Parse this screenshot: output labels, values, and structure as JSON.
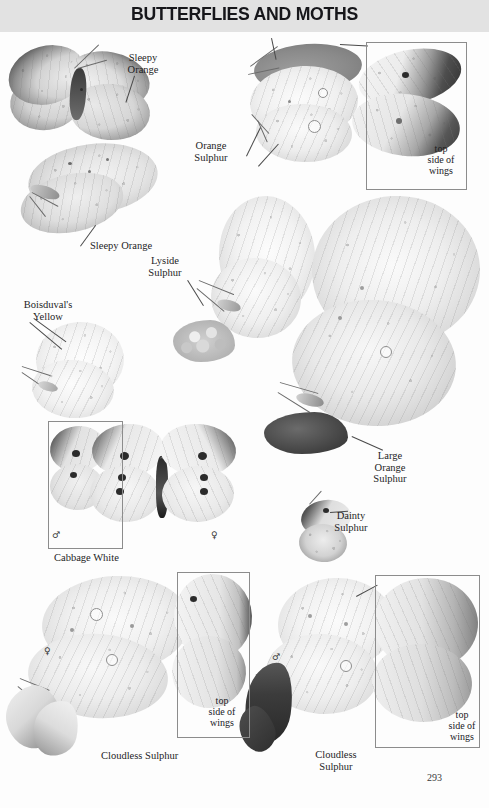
{
  "page": {
    "header_title": "BUTTERFLIES AND MOTHS",
    "page_number": "293",
    "background_color": "#fdfdfd",
    "header_band_color": "#e2e2e2",
    "text_color": "#1d1d1f"
  },
  "species_labels": [
    {
      "id": "sleepy-orange-top",
      "text": "Sleepy\nOrange",
      "x": 143,
      "y": 52,
      "align": "center"
    },
    {
      "id": "orange-sulphur",
      "text": "Orange\nSulphur",
      "x": 211,
      "y": 140,
      "align": "center"
    },
    {
      "id": "sleepy-orange-bottom",
      "text": "Sleepy Orange",
      "x": 90,
      "y": 240,
      "align": "left"
    },
    {
      "id": "lyside-sulphur",
      "text": "Lyside\nSulphur",
      "x": 165,
      "y": 255,
      "align": "center"
    },
    {
      "id": "boisduvals-yellow",
      "text": "Boisduval's\nYellow",
      "x": 42,
      "y": 299,
      "align": "center"
    },
    {
      "id": "large-orange-sulphur",
      "text": "Large\nOrange\nSulphur",
      "x": 389,
      "y": 450,
      "align": "center"
    },
    {
      "id": "dainty-sulphur",
      "text": "Dainty\nSulphur",
      "x": 350,
      "y": 510,
      "align": "center"
    },
    {
      "id": "cabbage-white",
      "text": "Cabbage White",
      "x": 54,
      "y": 552,
      "align": "left"
    },
    {
      "id": "cloudless-sulphur-left",
      "text": "Cloudless Sulphur",
      "x": 101,
      "y": 750,
      "align": "left"
    },
    {
      "id": "cloudless-sulphur-right",
      "text": "Cloudless\nSulphur",
      "x": 335,
      "y": 749,
      "align": "center"
    }
  ],
  "inset_boxes": [
    {
      "id": "top-side-wings-orange-sulphur",
      "caption": "top\nside of\nwings",
      "x": 366,
      "y": 42,
      "w": 101,
      "h": 148,
      "caption_x": 441,
      "caption_y": 149
    },
    {
      "id": "cabbage-white-specimen-frame",
      "caption": "",
      "x": 48,
      "y": 421,
      "w": 75,
      "h": 128,
      "caption_x": 0,
      "caption_y": 0
    },
    {
      "id": "top-side-wings-cloudless-left",
      "caption": "top\nside of\nwings",
      "x": 177,
      "y": 572,
      "w": 73,
      "h": 166,
      "caption_x": 222,
      "caption_y": 701
    },
    {
      "id": "top-side-wings-cloudless-right",
      "caption": "top\nside of\nwings",
      "x": 375,
      "y": 575,
      "w": 105,
      "h": 173,
      "caption_x": 462,
      "caption_y": 715
    }
  ],
  "sex_symbols": [
    {
      "id": "cabbage-white-male",
      "symbol": "♂",
      "x": 52,
      "y": 530
    },
    {
      "id": "cabbage-white-female",
      "symbol": "♀",
      "x": 211,
      "y": 530
    },
    {
      "id": "cloudless-sulphur-female",
      "symbol": "♀",
      "x": 44,
      "y": 646
    },
    {
      "id": "cloudless-sulphur-male",
      "symbol": "♂",
      "x": 272,
      "y": 652
    }
  ],
  "specimens": [
    {
      "id": "sleepy-orange-upperside",
      "common_name": "Sleepy Orange",
      "view": "top side of wings"
    },
    {
      "id": "sleepy-orange-underside",
      "common_name": "Sleepy Orange",
      "view": "under side of wings"
    },
    {
      "id": "orange-sulphur",
      "common_name": "Orange Sulphur",
      "view": "under side of wings"
    },
    {
      "id": "orange-sulphur-upperside",
      "common_name": "Orange Sulphur",
      "view": "top side of wings"
    },
    {
      "id": "lyside-sulphur",
      "common_name": "Lyside Sulphur",
      "view": "under side of wings"
    },
    {
      "id": "boisduvals-yellow",
      "common_name": "Boisduval's Yellow",
      "view": "under side of wings"
    },
    {
      "id": "large-orange-sulphur",
      "common_name": "Large Orange Sulphur",
      "view": "under side of wings"
    },
    {
      "id": "cabbage-white",
      "common_name": "Cabbage White",
      "view": "top side of wings"
    },
    {
      "id": "dainty-sulphur",
      "common_name": "Dainty Sulphur",
      "view": "under side of wings"
    },
    {
      "id": "cloudless-sulphur-left",
      "common_name": "Cloudless Sulphur",
      "view": "under side of wings"
    },
    {
      "id": "cloudless-sulphur-right",
      "common_name": "Cloudless Sulphur",
      "view": "under side of wings"
    }
  ]
}
